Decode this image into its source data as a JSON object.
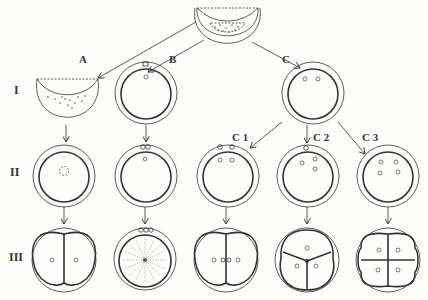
{
  "diagram": {
    "rows": [
      {
        "id": "I",
        "label": "I"
      },
      {
        "id": "II",
        "label": "II"
      },
      {
        "id": "III",
        "label": "III"
      }
    ],
    "columns": [
      {
        "id": "A",
        "label": "A"
      },
      {
        "id": "B",
        "label": "B"
      },
      {
        "id": "C",
        "label": "C"
      },
      {
        "id": "C1",
        "label": "C 1"
      },
      {
        "id": "C2",
        "label": "C 2"
      },
      {
        "id": "C3",
        "label": "C 3"
      }
    ],
    "top_stage": "half-bowl cell with granular contents (source)",
    "colors": {
      "ink": "#333333",
      "background": "#fdfdfc"
    }
  }
}
